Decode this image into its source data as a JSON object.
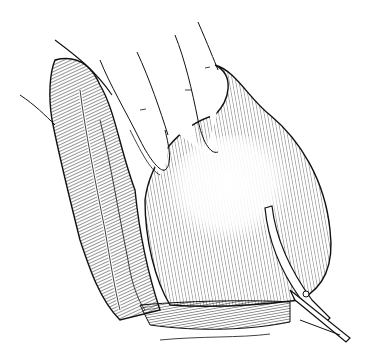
{
  "image": {
    "width": 366,
    "height": 363,
    "style": "black-and-white pen line drawing with hatching",
    "subject": "medical illustration: fingers pressing on a rounded tissue mass while scissors cut at its lower edge"
  },
  "colors": {
    "background": "#ffffff",
    "ink": "#111111"
  },
  "elements": {
    "hand": "fingers",
    "left_tissue": "folded tissue",
    "mass": "rounded mass",
    "base": "tissue base",
    "instrument": "scissors"
  }
}
